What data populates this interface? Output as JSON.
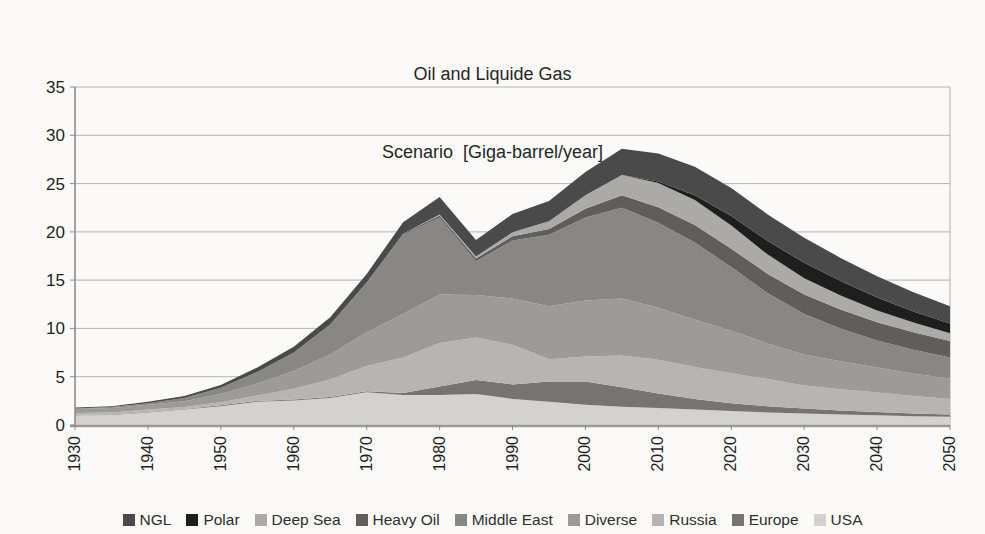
{
  "title": {
    "line1": "Oil and Liquide Gas",
    "line2": "Scenario  [Giga-barrel/year]"
  },
  "chart_data": {
    "type": "area",
    "stacked": true,
    "title": "Oil and Liquide Gas Scenario [Giga-barrel/year]",
    "xlabel": "",
    "ylabel": "",
    "unit": "Giga-barrel/year",
    "grid": "horizontal",
    "legend_position": "bottom",
    "xlim": [
      1930,
      2050
    ],
    "ylim": [
      0,
      35
    ],
    "xticks": [
      1930,
      1940,
      1950,
      1960,
      1970,
      1980,
      1990,
      2000,
      2010,
      2020,
      2030,
      2040,
      2050
    ],
    "yticks": [
      0,
      5,
      10,
      15,
      20,
      25,
      30,
      35
    ],
    "x": [
      1930,
      1935,
      1940,
      1945,
      1950,
      1955,
      1960,
      1965,
      1970,
      1975,
      1980,
      1985,
      1990,
      1995,
      2000,
      2005,
      2010,
      2015,
      2020,
      2025,
      2030,
      2035,
      2040,
      2045,
      2050
    ],
    "series": [
      {
        "name": "USA",
        "color": "#d4d2cf",
        "values": [
          1.0,
          1.05,
          1.3,
          1.6,
          1.95,
          2.4,
          2.55,
          2.8,
          3.4,
          3.1,
          3.1,
          3.2,
          2.7,
          2.4,
          2.1,
          1.9,
          1.75,
          1.6,
          1.45,
          1.3,
          1.2,
          1.1,
          1.0,
          0.9,
          0.85
        ]
      },
      {
        "name": "Europe",
        "color": "#757473",
        "values": [
          0.05,
          0.05,
          0.05,
          0.05,
          0.1,
          0.1,
          0.1,
          0.1,
          0.1,
          0.2,
          0.9,
          1.45,
          1.5,
          2.1,
          2.4,
          2.0,
          1.5,
          1.1,
          0.8,
          0.65,
          0.5,
          0.4,
          0.35,
          0.3,
          0.25
        ]
      },
      {
        "name": "Russia",
        "color": "#b7b5b2",
        "values": [
          0.2,
          0.2,
          0.25,
          0.2,
          0.3,
          0.55,
          1.1,
          1.8,
          2.6,
          3.7,
          4.5,
          4.4,
          4.1,
          2.3,
          2.6,
          3.3,
          3.5,
          3.3,
          3.1,
          2.8,
          2.4,
          2.2,
          2.0,
          1.8,
          1.6
        ]
      },
      {
        "name": "Diverse",
        "color": "#9d9b99",
        "values": [
          0.4,
          0.45,
          0.5,
          0.6,
          0.85,
          1.25,
          1.85,
          2.6,
          3.5,
          4.5,
          5.0,
          4.4,
          4.8,
          5.5,
          5.8,
          5.9,
          5.4,
          4.9,
          4.4,
          3.7,
          3.2,
          2.9,
          2.6,
          2.3,
          2.1
        ]
      },
      {
        "name": "Middle East",
        "color": "#888785",
        "values": [
          0.05,
          0.1,
          0.15,
          0.35,
          0.65,
          1.2,
          1.9,
          3.1,
          5.1,
          8.2,
          8.0,
          3.5,
          6.0,
          7.4,
          8.6,
          9.4,
          8.8,
          8.0,
          6.6,
          5.2,
          4.2,
          3.4,
          2.8,
          2.5,
          2.2
        ]
      },
      {
        "name": "Heavy Oil",
        "color": "#5f5e5d",
        "values": [
          0,
          0,
          0,
          0,
          0,
          0,
          0,
          0,
          0.05,
          0.1,
          0.2,
          0.3,
          0.45,
          0.6,
          0.9,
          1.3,
          1.6,
          1.8,
          1.9,
          2.0,
          2.0,
          1.95,
          1.9,
          1.8,
          1.7
        ]
      },
      {
        "name": "Deep Sea",
        "color": "#acaaa7",
        "values": [
          0,
          0,
          0,
          0,
          0,
          0,
          0,
          0,
          0,
          0,
          0.1,
          0.2,
          0.4,
          0.8,
          1.4,
          2.1,
          2.5,
          2.6,
          2.4,
          2.0,
          1.7,
          1.45,
          1.2,
          1.0,
          0.8
        ]
      },
      {
        "name": "Polar",
        "color": "#1e1e1e",
        "values": [
          0,
          0,
          0,
          0,
          0,
          0,
          0,
          0,
          0,
          0,
          0,
          0,
          0,
          0,
          0,
          0,
          0.15,
          0.5,
          1.0,
          1.4,
          1.6,
          1.5,
          1.35,
          1.15,
          1.0
        ]
      },
      {
        "name": "NGL",
        "color": "#4a4a4a",
        "values": [
          0.1,
          0.1,
          0.15,
          0.2,
          0.3,
          0.45,
          0.6,
          0.75,
          0.9,
          1.2,
          1.8,
          1.7,
          1.9,
          2.1,
          2.4,
          2.7,
          2.9,
          2.95,
          2.9,
          2.75,
          2.6,
          2.4,
          2.2,
          2.0,
          1.8
        ]
      }
    ],
    "legend_order": [
      "NGL",
      "Polar",
      "Deep Sea",
      "Heavy Oil",
      "Middle East",
      "Diverse",
      "Russia",
      "Europe",
      "USA"
    ]
  }
}
